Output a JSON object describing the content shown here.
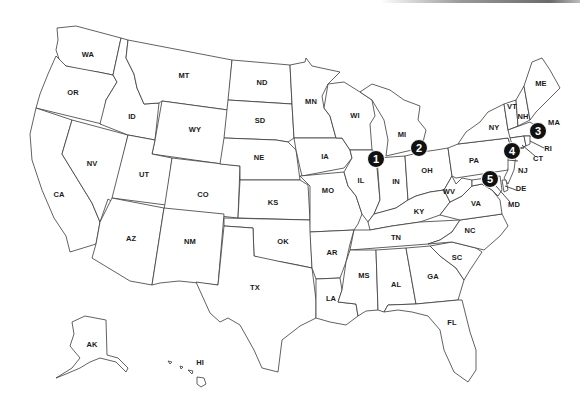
{
  "map": {
    "title": "United States map with numbered location markers",
    "decor": {
      "top_rule": "gray gradient line"
    },
    "states": [
      {
        "code": "WA",
        "x": 88,
        "y": 55
      },
      {
        "code": "OR",
        "x": 73,
        "y": 93
      },
      {
        "code": "CA",
        "x": 59,
        "y": 195
      },
      {
        "code": "NV",
        "x": 92,
        "y": 164
      },
      {
        "code": "ID",
        "x": 132,
        "y": 117
      },
      {
        "code": "MT",
        "x": 184,
        "y": 76
      },
      {
        "code": "WY",
        "x": 195,
        "y": 130
      },
      {
        "code": "UT",
        "x": 144,
        "y": 175
      },
      {
        "code": "CO",
        "x": 203,
        "y": 195
      },
      {
        "code": "AZ",
        "x": 131,
        "y": 239
      },
      {
        "code": "NM",
        "x": 190,
        "y": 242
      },
      {
        "code": "ND",
        "x": 262,
        "y": 83
      },
      {
        "code": "SD",
        "x": 260,
        "y": 121
      },
      {
        "code": "NE",
        "x": 259,
        "y": 158
      },
      {
        "code": "KS",
        "x": 273,
        "y": 203
      },
      {
        "code": "OK",
        "x": 283,
        "y": 242
      },
      {
        "code": "TX",
        "x": 255,
        "y": 288
      },
      {
        "code": "MN",
        "x": 311,
        "y": 102
      },
      {
        "code": "IA",
        "x": 325,
        "y": 157
      },
      {
        "code": "MO",
        "x": 328,
        "y": 191
      },
      {
        "code": "AR",
        "x": 332,
        "y": 253
      },
      {
        "code": "LA",
        "x": 331,
        "y": 299
      },
      {
        "code": "WI",
        "x": 355,
        "y": 116
      },
      {
        "code": "IL",
        "x": 361,
        "y": 181
      },
      {
        "code": "MI",
        "x": 402,
        "y": 135
      },
      {
        "code": "IN",
        "x": 396,
        "y": 182
      },
      {
        "code": "OH",
        "x": 427,
        "y": 171
      },
      {
        "code": "KY",
        "x": 419,
        "y": 212
      },
      {
        "code": "TN",
        "x": 396,
        "y": 238
      },
      {
        "code": "MS",
        "x": 364,
        "y": 276
      },
      {
        "code": "AL",
        "x": 396,
        "y": 285
      },
      {
        "code": "GA",
        "x": 433,
        "y": 277
      },
      {
        "code": "FL",
        "x": 452,
        "y": 323
      },
      {
        "code": "SC",
        "x": 457,
        "y": 258
      },
      {
        "code": "NC",
        "x": 470,
        "y": 231
      },
      {
        "code": "VA",
        "x": 476,
        "y": 204
      },
      {
        "code": "WV",
        "x": 449,
        "y": 192
      },
      {
        "code": "PA",
        "x": 474,
        "y": 161
      },
      {
        "code": "NY",
        "x": 494,
        "y": 128
      },
      {
        "code": "VT",
        "x": 512,
        "y": 107
      },
      {
        "code": "NH",
        "x": 523,
        "y": 117
      },
      {
        "code": "ME",
        "x": 541,
        "y": 84
      },
      {
        "code": "MA",
        "x": 554,
        "y": 123
      },
      {
        "code": "RI",
        "x": 548,
        "y": 149
      },
      {
        "code": "CT",
        "x": 538,
        "y": 159
      },
      {
        "code": "NJ",
        "x": 523,
        "y": 171
      },
      {
        "code": "DE",
        "x": 521,
        "y": 189
      },
      {
        "code": "MD",
        "x": 514,
        "y": 205
      },
      {
        "code": "AK",
        "x": 92,
        "y": 345
      },
      {
        "code": "HI",
        "x": 200,
        "y": 363
      }
    ],
    "markers": [
      {
        "number": "1",
        "x": 376,
        "y": 159
      },
      {
        "number": "2",
        "x": 419,
        "y": 148
      },
      {
        "number": "3",
        "x": 538,
        "y": 131
      },
      {
        "number": "4",
        "x": 512,
        "y": 151
      },
      {
        "number": "5",
        "x": 490,
        "y": 179
      }
    ]
  }
}
